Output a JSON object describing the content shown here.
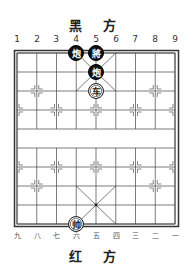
{
  "board": {
    "top_side_label": "黑 方",
    "bottom_side_label": "红 方",
    "top_file_labels": [
      "1",
      "2",
      "3",
      "4",
      "5",
      "6",
      "7",
      "8",
      "9"
    ],
    "bottom_file_labels": [
      "九",
      "八",
      "七",
      "六",
      "五",
      "四",
      "三",
      "二",
      "一"
    ],
    "colors": {
      "line": "#333333",
      "black_piece": "#111111",
      "red_piece_bg": "#ffffff"
    }
  },
  "pieces": [
    {
      "name": "black-cannon",
      "char": "炮",
      "side": "black",
      "file": 4,
      "rank": 0
    },
    {
      "name": "black-general",
      "char": "將",
      "side": "black",
      "file": 5,
      "rank": 0
    },
    {
      "name": "black-cannon",
      "char": "炮",
      "side": "black",
      "file": 5,
      "rank": 1
    },
    {
      "name": "red-chariot",
      "char": "车",
      "side": "red",
      "file": 5,
      "rank": 2
    },
    {
      "name": "red-marshal",
      "char": "帅",
      "side": "red",
      "file": 4,
      "rank": 9
    }
  ]
}
